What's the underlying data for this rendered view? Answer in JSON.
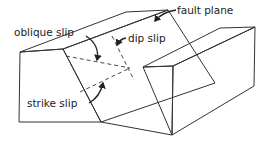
{
  "diagram": {
    "labels": {
      "fault_plane": "fault plane",
      "oblique_slip": "oblique slip",
      "dip_slip": "dip slip",
      "strike_slip": "strike slip"
    },
    "colors": {
      "line": "#333333",
      "stipple": "#8a8a8a",
      "background": "#ffffff"
    }
  }
}
